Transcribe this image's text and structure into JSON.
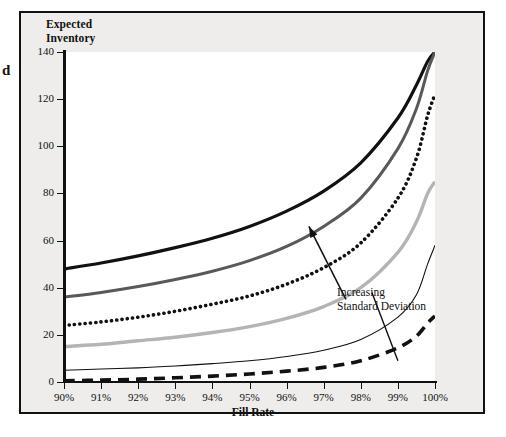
{
  "figure": {
    "background_color": "#eeedeb",
    "plot_background_color": "#ffffff",
    "border_color": "#111111",
    "margin_glyph": "d"
  },
  "chart_data": {
    "type": "line",
    "title": "",
    "ylabel_line1": "Expected",
    "ylabel_line2": "Inventory",
    "xlabel": "Fill Rate",
    "ylabel": "Expected Inventory",
    "xlim": [
      90,
      100
    ],
    "ylim": [
      0,
      140
    ],
    "grid": false,
    "legend_position": "none",
    "x_tick_labels": [
      "90%",
      "91%",
      "92%",
      "93%",
      "94%",
      "95%",
      "96%",
      "97%",
      "98%",
      "99%",
      "100%"
    ],
    "x_tick_values": [
      90,
      91,
      92,
      93,
      94,
      95,
      96,
      97,
      98,
      99,
      100
    ],
    "y_tick_labels": [
      "0",
      "20",
      "40",
      "60",
      "80",
      "100",
      "120",
      "140"
    ],
    "y_tick_values": [
      0,
      20,
      40,
      60,
      80,
      100,
      120,
      140
    ],
    "annotations": [
      {
        "text_line1": "Increasing",
        "text_line2": "Standard Deviation",
        "arrow_from_x": 97.6,
        "arrow_from_y": 35,
        "arrow_to_x": 96.6,
        "arrow_to_y": 66
      }
    ],
    "x": [
      90,
      91,
      92,
      93,
      94,
      95,
      96,
      97,
      98,
      99,
      99.5,
      99.8,
      100
    ],
    "series": [
      {
        "name": "sigma-6 (highest)",
        "style": "solid",
        "color": "#111111",
        "width": 3.2,
        "values": [
          48,
          50.5,
          53.5,
          57,
          61,
          66,
          72.5,
          81,
          93,
          112,
          126,
          136,
          140
        ]
      },
      {
        "name": "sigma-5",
        "style": "solid",
        "color": "#595959",
        "width": 3.0,
        "values": [
          36,
          38,
          40.5,
          43.5,
          47,
          51.5,
          57.5,
          66,
          78,
          99,
          116,
          132,
          140
        ]
      },
      {
        "name": "sigma-4",
        "style": "dotted",
        "color": "#111111",
        "width": 3.6,
        "values": [
          24,
          25.5,
          27.5,
          30,
          33,
          36.5,
          41.5,
          48.5,
          59,
          78,
          95,
          113,
          122
        ]
      },
      {
        "name": "sigma-3",
        "style": "solid",
        "color": "#b4b4b4",
        "width": 3.4,
        "values": [
          15,
          16,
          17.5,
          19,
          21,
          23.5,
          27,
          32,
          40,
          55,
          68,
          80,
          85
        ]
      },
      {
        "name": "sigma-2",
        "style": "solid",
        "color": "#111111",
        "width": 1.1,
        "values": [
          5,
          5.5,
          6,
          6.8,
          7.8,
          9,
          10.8,
          13.5,
          18,
          27.5,
          37,
          50,
          58
        ]
      },
      {
        "name": "sigma-1 (lowest)",
        "style": "dashed",
        "color": "#111111",
        "width": 3.6,
        "values": [
          0.5,
          0.8,
          1.2,
          1.8,
          2.5,
          3.4,
          4.6,
          6.2,
          9,
          14.5,
          19.5,
          25,
          28
        ]
      }
    ],
    "leader_line": {
      "from_x": 98.3,
      "from_y": 38,
      "to_x": 99.0,
      "to_y": 9
    }
  }
}
